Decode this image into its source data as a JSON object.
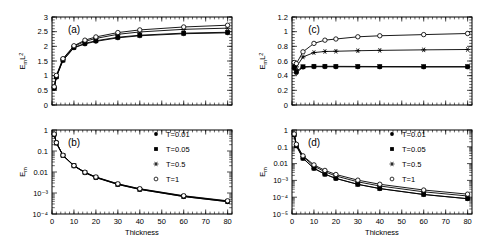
{
  "figure": {
    "xlabel": "Thickness",
    "panels": [
      "(a)",
      "(b)",
      "(c)",
      "(d)"
    ]
  },
  "legend": {
    "entries": [
      {
        "label": "T=0.01",
        "marker": "filled-circle"
      },
      {
        "label": "T=0.05",
        "marker": "filled-square"
      },
      {
        "label": "T=0.5",
        "marker": "asterisk"
      },
      {
        "label": "T=1",
        "marker": "open-circle"
      }
    ]
  },
  "axis_text": {
    "y_a": [
      "0",
      "0.5",
      "1",
      "1.5",
      "2",
      "2.5",
      "3"
    ],
    "y_b": [
      "10⁻⁴",
      "10⁻³",
      "0.01",
      "0.1",
      "1"
    ],
    "y_c": [
      "0",
      "0.2",
      "0.4",
      "0.6",
      "0.8",
      "1",
      "1.2"
    ],
    "y_d": [
      "10⁻⁵",
      "10⁻⁴",
      "10⁻³",
      "0.01",
      "0.1",
      "1"
    ],
    "x": [
      "0",
      "10",
      "20",
      "30",
      "40",
      "50",
      "60",
      "70",
      "80"
    ],
    "ylabel_a": "E",
    "ylabel_a_sub": "m",
    "ylabel_a_tail": "L",
    "ylabel_a_sup": "2",
    "ylabel_b": "E",
    "ylabel_b_sub": "m"
  },
  "chart_data": [
    {
      "type": "line",
      "panel": "(a)",
      "title": "(a)",
      "xlabel": "Thickness",
      "ylabel": "E_m L^2",
      "xlim": [
        0,
        82
      ],
      "ylim": [
        0,
        3
      ],
      "yscale": "linear",
      "yticks": [
        0,
        0.5,
        1,
        1.5,
        2,
        2.5,
        3
      ],
      "xticks": [
        0,
        10,
        20,
        30,
        40,
        50,
        60,
        70,
        80
      ],
      "grid": false,
      "legend": "none",
      "x": [
        1,
        2,
        5,
        10,
        15,
        20,
        30,
        40,
        60,
        80
      ],
      "series": [
        {
          "name": "T=0.01",
          "marker": "filled-circle",
          "values": [
            0.57,
            0.95,
            1.52,
            1.95,
            2.08,
            2.17,
            2.29,
            2.36,
            2.43,
            2.46
          ]
        },
        {
          "name": "T=0.05",
          "marker": "filled-square",
          "values": [
            0.58,
            0.96,
            1.53,
            1.96,
            2.1,
            2.19,
            2.31,
            2.38,
            2.45,
            2.48
          ]
        },
        {
          "name": "T=0.5",
          "marker": "asterisk",
          "values": [
            0.6,
            0.99,
            1.56,
            2.0,
            2.17,
            2.27,
            2.41,
            2.49,
            2.58,
            2.62
          ]
        },
        {
          "name": "T=1",
          "marker": "open-circle",
          "values": [
            0.62,
            1.01,
            1.58,
            2.02,
            2.21,
            2.32,
            2.47,
            2.56,
            2.66,
            2.72
          ]
        }
      ]
    },
    {
      "type": "line",
      "panel": "(b)",
      "title": "(b)",
      "xlabel": "Thickness",
      "ylabel": "E_m",
      "xlim": [
        0,
        82
      ],
      "ylim": [
        0.0001,
        1
      ],
      "yscale": "log",
      "yticks": [
        0.0001,
        0.001,
        0.01,
        0.1,
        1
      ],
      "xticks": [
        0,
        10,
        20,
        30,
        40,
        50,
        60,
        70,
        80
      ],
      "grid": false,
      "legend": "right",
      "x": [
        1,
        2,
        5,
        10,
        15,
        20,
        30,
        40,
        60,
        80
      ],
      "series": [
        {
          "name": "T=0.01",
          "marker": "filled-circle",
          "values": [
            0.62,
            0.24,
            0.061,
            0.0195,
            0.0092,
            0.0054,
            0.00254,
            0.00148,
            0.000675,
            0.000385
          ]
        },
        {
          "name": "T=0.05",
          "marker": "filled-square",
          "values": [
            0.62,
            0.24,
            0.061,
            0.0196,
            0.0093,
            0.0055,
            0.00257,
            0.00149,
            0.000681,
            0.000388
          ]
        },
        {
          "name": "T=0.5",
          "marker": "asterisk",
          "values": [
            0.63,
            0.25,
            0.062,
            0.02,
            0.0096,
            0.0057,
            0.00268,
            0.00156,
            0.000717,
            0.000409
          ]
        },
        {
          "name": "T=1",
          "marker": "open-circle",
          "values": [
            0.64,
            0.25,
            0.063,
            0.0202,
            0.0098,
            0.0058,
            0.00274,
            0.0016,
            0.000739,
            0.000425
          ]
        }
      ]
    },
    {
      "type": "line",
      "panel": "(c)",
      "title": "(c)",
      "xlabel": "Thickness",
      "ylabel": "E_m L^2",
      "xlim": [
        0,
        82
      ],
      "ylim": [
        0,
        1.2
      ],
      "yscale": "linear",
      "yticks": [
        0,
        0.2,
        0.4,
        0.6,
        0.8,
        1,
        1.2
      ],
      "xticks": [
        0,
        10,
        20,
        30,
        40,
        50,
        60,
        70,
        80
      ],
      "grid": false,
      "legend": "none",
      "x": [
        1,
        2,
        5,
        10,
        15,
        20,
        30,
        40,
        60,
        80
      ],
      "series": [
        {
          "name": "T=0.01",
          "marker": "filled-circle",
          "values": [
            0.5,
            0.44,
            0.515,
            0.522,
            0.522,
            0.521,
            0.52,
            0.519,
            0.518,
            0.518
          ]
        },
        {
          "name": "T=0.05",
          "marker": "filled-square",
          "values": [
            0.52,
            0.46,
            0.522,
            0.528,
            0.528,
            0.527,
            0.526,
            0.525,
            0.524,
            0.524
          ]
        },
        {
          "name": "T=0.5",
          "marker": "asterisk",
          "values": [
            0.57,
            0.52,
            0.655,
            0.715,
            0.73,
            0.733,
            0.74,
            0.745,
            0.752,
            0.757
          ]
        },
        {
          "name": "T=1",
          "marker": "open-circle",
          "values": [
            0.58,
            0.565,
            0.725,
            0.84,
            0.884,
            0.9,
            0.93,
            0.944,
            0.96,
            0.975
          ]
        }
      ]
    },
    {
      "type": "line",
      "panel": "(d)",
      "title": "(d)",
      "xlabel": "Thickness",
      "ylabel": "E_m",
      "xlim": [
        0,
        82
      ],
      "ylim": [
        1e-05,
        1
      ],
      "yscale": "log",
      "yticks": [
        1e-05,
        0.0001,
        0.001,
        0.01,
        0.1,
        1
      ],
      "xticks": [
        0,
        10,
        20,
        30,
        40,
        50,
        60,
        70,
        80
      ],
      "grid": false,
      "legend": "right",
      "x": [
        1,
        2,
        5,
        10,
        15,
        20,
        30,
        40,
        60,
        80
      ],
      "series": [
        {
          "name": "T=0.01",
          "marker": "filled-circle",
          "values": [
            0.5,
            0.112,
            0.0206,
            0.00522,
            0.00232,
            0.0013,
            0.000578,
            0.000324,
            0.000144,
            8.1e-05
          ]
        },
        {
          "name": "T=0.05",
          "marker": "filled-square",
          "values": [
            0.52,
            0.116,
            0.0209,
            0.00528,
            0.00235,
            0.00132,
            0.000585,
            0.000328,
            0.000146,
            8.19e-05
          ]
        },
        {
          "name": "T=0.5",
          "marker": "asterisk",
          "values": [
            0.57,
            0.13,
            0.0262,
            0.00715,
            0.00324,
            0.00183,
            0.000822,
            0.000466,
            0.000209,
            0.000118
          ]
        },
        {
          "name": "T=1",
          "marker": "open-circle",
          "values": [
            0.58,
            0.141,
            0.029,
            0.0084,
            0.00393,
            0.00225,
            0.001033,
            0.00059,
            0.000267,
            0.000152
          ]
        }
      ]
    }
  ]
}
